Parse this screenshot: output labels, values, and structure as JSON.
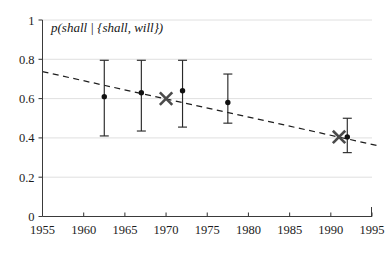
{
  "chart_data": {
    "type": "scatter",
    "title": "",
    "series_label": "p(shall | {shall, will})",
    "xlabel": "",
    "ylabel": "",
    "xlim": [
      1955,
      1995
    ],
    "ylim": [
      0,
      1
    ],
    "xticks": [
      1955,
      1960,
      1965,
      1970,
      1975,
      1980,
      1985,
      1990,
      1995
    ],
    "xtick_labels": [
      "1955",
      "1960",
      "1965",
      "1970",
      "1975",
      "1980",
      "1985",
      "1990",
      "1995"
    ],
    "yticks": [
      0,
      0.2,
      0.4,
      0.6,
      0.8,
      1
    ],
    "ytick_labels": [
      "0",
      "0.2",
      "0.4",
      "0.6",
      "0.8",
      "1"
    ],
    "grid": true,
    "grid_axis": "y",
    "legend": "none",
    "series": [
      {
        "name": "corpus estimate",
        "marker": "dot-with-errorbar",
        "points": [
          {
            "x": 1962.5,
            "y": 0.61,
            "yerr_low": 0.41,
            "yerr_high": 0.795
          },
          {
            "x": 1967.0,
            "y": 0.63,
            "yerr_low": 0.435,
            "yerr_high": 0.795
          },
          {
            "x": 1972.0,
            "y": 0.64,
            "yerr_low": 0.455,
            "yerr_high": 0.795
          },
          {
            "x": 1977.5,
            "y": 0.58,
            "yerr_low": 0.475,
            "yerr_high": 0.725
          },
          {
            "x": 1992.0,
            "y": 0.405,
            "yerr_low": 0.325,
            "yerr_high": 0.5
          }
        ]
      },
      {
        "name": "reference point",
        "marker": "x",
        "points": [
          {
            "x": 1970.0,
            "y": 0.6
          },
          {
            "x": 1991.0,
            "y": 0.405
          }
        ]
      }
    ],
    "trend": {
      "name": "fitted trend",
      "style": "dashed",
      "x_start": 1955.0,
      "y_start": 0.737,
      "x_end": 1996.0,
      "y_end": 0.358
    },
    "colors": {
      "marker": "#111111",
      "errorbar": "#2a2a2a",
      "x_marker": "#4a4a4a",
      "trend": "#1e1e1e",
      "grid": "#d8d8d8",
      "axis": "#3a3a3a",
      "background": "#ffffff"
    }
  }
}
